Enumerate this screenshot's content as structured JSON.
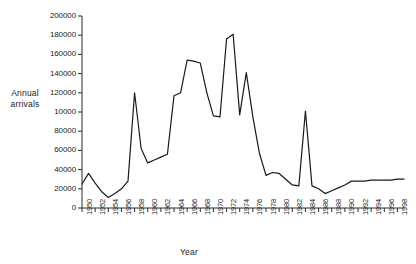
{
  "chart_data": {
    "type": "line",
    "title": "",
    "xlabel": "Year",
    "ylabel": "Annual arrivals",
    "ylabel_lines": [
      "Annual",
      "arrivals"
    ],
    "xlim": [
      1950,
      1999
    ],
    "ylim": [
      0,
      200000
    ],
    "grid": false,
    "legend": null,
    "y_ticks": [
      0,
      20000,
      40000,
      60000,
      80000,
      100000,
      120000,
      140000,
      160000,
      180000,
      200000
    ],
    "y_tick_labels": [
      "0",
      "20000",
      "40000",
      "60000",
      "80000",
      "10000",
      "120000",
      "140000",
      "160000",
      "180000",
      "200000"
    ],
    "x_tick_labels": [
      "1950",
      "1952",
      "1954",
      "1956",
      "1958",
      "1960",
      "1962",
      "1964",
      "1966",
      "1968",
      "1970",
      "1972",
      "1974",
      "1976",
      "1978",
      "1980",
      "1982",
      "1984",
      "1986",
      "1988",
      "1990",
      "1992",
      "1994",
      "1996",
      "1998"
    ],
    "x": [
      1950,
      1951,
      1952,
      1953,
      1954,
      1955,
      1956,
      1957,
      1958,
      1959,
      1960,
      1961,
      1962,
      1963,
      1964,
      1965,
      1966,
      1967,
      1968,
      1969,
      1970,
      1971,
      1972,
      1973,
      1974,
      1975,
      1976,
      1977,
      1978,
      1979,
      1980,
      1981,
      1982,
      1983,
      1984,
      1985,
      1986,
      1987,
      1988,
      1989,
      1990,
      1991,
      1992,
      1993,
      1994,
      1995,
      1996,
      1997,
      1998,
      1999
    ],
    "values": [
      25000,
      36000,
      26000,
      17000,
      11000,
      15000,
      20000,
      28000,
      120000,
      62000,
      47000,
      50000,
      53000,
      56000,
      117000,
      120000,
      154000,
      153000,
      151000,
      120000,
      96000,
      95000,
      176000,
      181000,
      97000,
      141000,
      95000,
      57000,
      34000,
      37000,
      36000,
      30000,
      24000,
      23000,
      101000,
      23000,
      20000,
      15000,
      18000,
      21000,
      24000,
      28000,
      28000,
      28000,
      29000,
      29000,
      29000,
      29000,
      30000,
      30000
    ],
    "series_name": "Annual arrivals",
    "line_color": "#1a1a1a",
    "line_width": 1.2
  }
}
